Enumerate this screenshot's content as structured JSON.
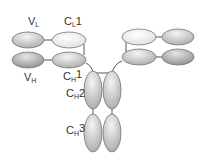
{
  "diagram": {
    "labels": {
      "vl": {
        "main": "V",
        "sub": "L",
        "suffix": ""
      },
      "cl1": {
        "main": "C",
        "sub": "L",
        "suffix": "1"
      },
      "vh": {
        "main": "V",
        "sub": "H",
        "suffix": ""
      },
      "ch1": {
        "main": "C",
        "sub": "H",
        "suffix": "1"
      },
      "ch2": {
        "main": "C",
        "sub": "H",
        "suffix": "2"
      },
      "ch3": {
        "main": "C",
        "sub": "H",
        "suffix": "3"
      }
    },
    "colors": {
      "light_domain": "#f2f2f2",
      "mid_domain": "#cfcfcf",
      "dark_domain": "#a8a8a8",
      "outline": "#777777",
      "line": "#555555"
    }
  }
}
